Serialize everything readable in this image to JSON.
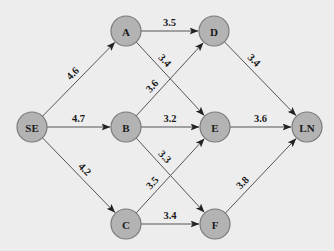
{
  "diagram": {
    "type": "directed-network",
    "node_radius": 15,
    "colors": {
      "background": "#ededed",
      "node_fill": "#b3b3b3",
      "node_stroke": "#7a7a7a",
      "edge": "#555555",
      "text": "#1a1a1a"
    },
    "nodes": [
      {
        "id": "SE",
        "label": "SE",
        "x": 32,
        "y": 127
      },
      {
        "id": "A",
        "label": "A",
        "x": 126,
        "y": 31
      },
      {
        "id": "B",
        "label": "B",
        "x": 126,
        "y": 127
      },
      {
        "id": "C",
        "label": "C",
        "x": 126,
        "y": 224
      },
      {
        "id": "D",
        "label": "D",
        "x": 214,
        "y": 31
      },
      {
        "id": "E",
        "label": "E",
        "x": 215,
        "y": 127
      },
      {
        "id": "F",
        "label": "F",
        "x": 215,
        "y": 224
      },
      {
        "id": "LN",
        "label": "LN",
        "x": 307,
        "y": 127
      }
    ],
    "edges": [
      {
        "from": "SE",
        "to": "A",
        "label": "4.6"
      },
      {
        "from": "SE",
        "to": "B",
        "label": "4.7"
      },
      {
        "from": "SE",
        "to": "C",
        "label": "4.2"
      },
      {
        "from": "A",
        "to": "D",
        "label": "3.5"
      },
      {
        "from": "A",
        "to": "E",
        "label": "3.4"
      },
      {
        "from": "B",
        "to": "D",
        "label": "3.6"
      },
      {
        "from": "B",
        "to": "E",
        "label": "3.2"
      },
      {
        "from": "B",
        "to": "F",
        "label": "3.3"
      },
      {
        "from": "C",
        "to": "E",
        "label": "3.5"
      },
      {
        "from": "C",
        "to": "F",
        "label": "3.4"
      },
      {
        "from": "D",
        "to": "LN",
        "label": "3.4"
      },
      {
        "from": "E",
        "to": "LN",
        "label": "3.6"
      },
      {
        "from": "F",
        "to": "LN",
        "label": "3.8"
      }
    ]
  }
}
